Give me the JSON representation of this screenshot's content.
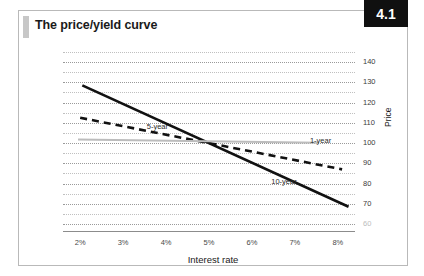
{
  "card": {
    "title": "The price/yield curve",
    "badge": "4.1"
  },
  "chart_data": {
    "type": "line",
    "title": "The price/yield curve",
    "xlabel": "Interest rate",
    "ylabel": "Price",
    "x": [
      2,
      3,
      4,
      5,
      6,
      7,
      8
    ],
    "xtick_labels": [
      "2%",
      "3%",
      "4%",
      "5%",
      "6%",
      "7%",
      "8%"
    ],
    "ytick_labels": [
      "140",
      "130",
      "120",
      "110",
      "100",
      "90",
      "80",
      "70",
      "60"
    ],
    "ytick_values": [
      140,
      130,
      120,
      110,
      100,
      90,
      80,
      70,
      60
    ],
    "ylim": [
      60,
      145
    ],
    "xlim": [
      1.6,
      8.4
    ],
    "grid": true,
    "legend": "inline-labels",
    "series": [
      {
        "name": "10-year",
        "style": "solid-thick-black",
        "color": "#111111",
        "label_x": 6.45,
        "label_y": 81,
        "x": [
          2.05,
          8.25
        ],
        "values": [
          128.5,
          68.5
        ]
      },
      {
        "name": "5-year",
        "style": "dashed-thick-black",
        "color": "#111111",
        "label_x": 3.55,
        "label_y": 108,
        "x": [
          2.0,
          8.1
        ],
        "values": [
          112.5,
          87.0
        ]
      },
      {
        "name": "1-year",
        "style": "solid-thin-gray",
        "color": "#bcbcbc",
        "label_x": 7.35,
        "label_y": 101,
        "x": [
          1.95,
          7.55
        ],
        "values": [
          101.8,
          100.2
        ]
      }
    ]
  }
}
